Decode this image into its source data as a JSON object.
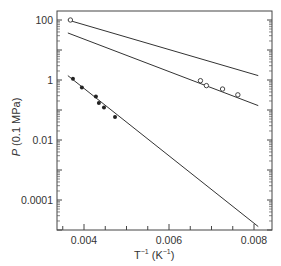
{
  "chart_data": {
    "type": "scatter",
    "title": "",
    "xlabel": "T⁻¹ (K⁻¹)",
    "ylabel": "P (0.1 MPa)",
    "xscale": "linear",
    "yscale": "log",
    "xlim": [
      0.00336,
      0.0084
    ],
    "ylim": [
      1e-05,
      300
    ],
    "x_ticks": [
      "0.004",
      "0.006",
      "0.008"
    ],
    "y_ticks": [
      "100",
      "1",
      "0.01",
      "0.0001"
    ],
    "grid": false,
    "series": [
      {
        "name": "fit line upper",
        "kind": "line",
        "x": [
          0.00362,
          0.0081
        ],
        "y": [
          100,
          1.4
        ]
      },
      {
        "name": "fit line middle",
        "kind": "line",
        "x": [
          0.00362,
          0.0081
        ],
        "y": [
          37,
          0.14
        ]
      },
      {
        "name": "fit line lower",
        "kind": "line",
        "x": [
          0.00362,
          0.0081
        ],
        "y": [
          1.4,
          1.3e-05
        ]
      },
      {
        "name": "open circles",
        "kind": "scatter",
        "marker": "open",
        "x": [
          0.00368,
          0.00674,
          0.00688,
          0.00726,
          0.00762
        ],
        "y": [
          100,
          0.95,
          0.65,
          0.5,
          0.32
        ]
      },
      {
        "name": "filled circles",
        "kind": "scatter",
        "marker": "filled",
        "x": [
          0.00374,
          0.00395,
          0.00428,
          0.00435,
          0.00447,
          0.00473
        ],
        "y": [
          1.1,
          0.56,
          0.28,
          0.17,
          0.12,
          0.058
        ]
      }
    ]
  },
  "labels": {
    "ylabel_p": "P",
    "ylabel_rest": " (0.1 MPa)",
    "xlabel_t": "T",
    "xlabel_exp": "−1",
    "xlabel_mid": " (K",
    "xlabel_exp2": "−1",
    "xlabel_end": ")"
  }
}
